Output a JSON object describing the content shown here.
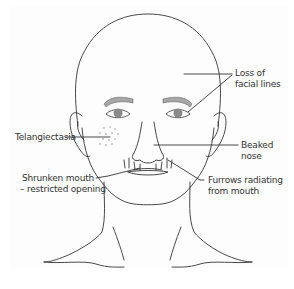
{
  "figure": {
    "line_color": "#333333",
    "eye_fill": "#8a8a8a",
    "brow_fill": "#a6a6a6",
    "spot_color": "#bdbdbd"
  },
  "labels": {
    "loss_of_facial_lines": {
      "line1": "Loss of",
      "line2": "facial lines"
    },
    "telangiectasia": {
      "line1": "Telangiectasia"
    },
    "beaked_nose": {
      "line1": "Beaked",
      "line2": "nose"
    },
    "shrunken_mouth": {
      "line1": "Shrunken mouth",
      "line2": "– restricted opening"
    },
    "furrows": {
      "line1": "Furrows radiating",
      "line2": "from mouth"
    }
  }
}
